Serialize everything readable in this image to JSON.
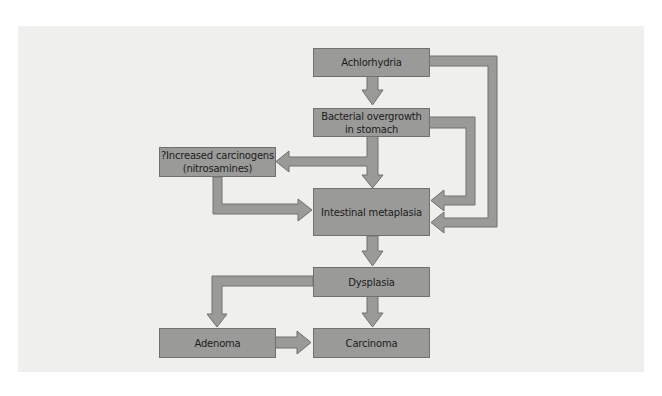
{
  "diagram": {
    "type": "flowchart",
    "nodes": {
      "achlorhydria": "Achlorhydria",
      "bacterial_line1": "Bacterial overgrowth",
      "bacterial_line2": "in stomach",
      "carcinogens_line1": "?Increased carcinogens",
      "carcinogens_line2": "(nitrosamines)",
      "metaplasia": "Intestinal metaplasia",
      "dysplasia": "Dysplasia",
      "adenoma": "Adenoma",
      "carcinoma": "Carcinoma"
    },
    "edges": [
      {
        "from": "Achlorhydria",
        "to": "Bacterial overgrowth in stomach"
      },
      {
        "from": "Achlorhydria",
        "to": "Intestinal metaplasia"
      },
      {
        "from": "Bacterial overgrowth in stomach",
        "to": "?Increased carcinogens (nitrosamines)"
      },
      {
        "from": "Bacterial overgrowth in stomach",
        "to": "Intestinal metaplasia"
      },
      {
        "from": "Bacterial overgrowth in stomach",
        "to": "Intestinal metaplasia",
        "route": "right"
      },
      {
        "from": "?Increased carcinogens (nitrosamines)",
        "to": "Intestinal metaplasia"
      },
      {
        "from": "Intestinal metaplasia",
        "to": "Dysplasia"
      },
      {
        "from": "Dysplasia",
        "to": "Adenoma"
      },
      {
        "from": "Dysplasia",
        "to": "Carcinoma"
      },
      {
        "from": "Adenoma",
        "to": "Carcinoma"
      }
    ],
    "colors": {
      "box": "#9a9a98",
      "background": "#efefed",
      "text": "#1c1c1c"
    }
  }
}
